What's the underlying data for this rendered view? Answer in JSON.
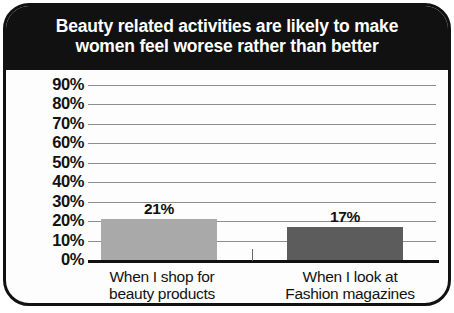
{
  "chart_data": {
    "type": "bar",
    "title": "Beauty related activities are likely to make women feel worese rather than better",
    "title_line1": "Beauty related activities are likely to make",
    "title_line2": "women feel worese rather than better",
    "xlabel": "",
    "ylabel": "",
    "ylim": [
      0,
      90
    ],
    "grid": true,
    "legend": "none",
    "categories": [
      "When I shop for beauty products",
      "When I look at Fashion magazines"
    ],
    "category_lines": [
      {
        "line1": "When I shop for",
        "line2": "beauty products"
      },
      {
        "line1": "When I look at",
        "line2": "Fashion magazines"
      }
    ],
    "values": [
      21,
      17
    ],
    "value_labels": [
      "21%",
      "17%"
    ],
    "bar_colors": [
      "#a9a9a9",
      "#5c5c5c"
    ],
    "y_ticks": [
      0,
      10,
      20,
      30,
      40,
      50,
      60,
      70,
      80,
      90
    ],
    "y_tick_labels": [
      "0%",
      "10%",
      "20%",
      "30%",
      "40%",
      "50%",
      "60%",
      "70%",
      "80%",
      "90%"
    ]
  },
  "style": {
    "banner_bg": "#111111",
    "banner_text": "#ffffff",
    "frame_border": "#111111",
    "plot_bg": "#fdfdfd",
    "gridline_color": "#8d8d8d",
    "axis_color": "#111111"
  }
}
